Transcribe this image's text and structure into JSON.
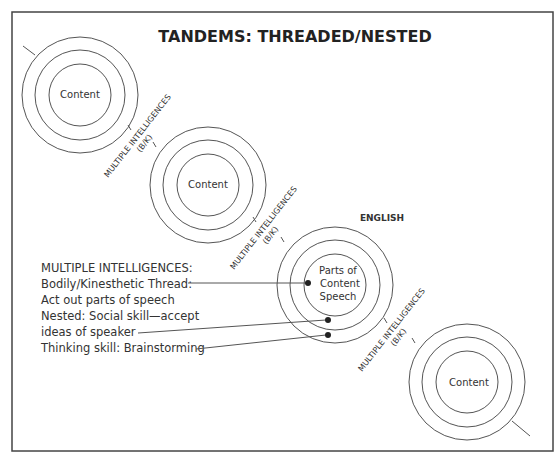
{
  "title": "TANDEMS: THREADED/NESTED",
  "circles": [
    {
      "label": "Content"
    },
    {
      "label": "Content"
    },
    {
      "label_lines": [
        "Parts of",
        "Content",
        "Speech"
      ],
      "subject": "ENGLISH"
    },
    {
      "label": "Content"
    }
  ],
  "thread_labels": [
    {
      "line1": "MULTIPLE INTELLIGENCES",
      "line2": "(B/K)"
    },
    {
      "line1": "MULTIPLE INTELLIGENCES",
      "line2": "(B/K)"
    },
    {
      "line1": "MULTIPLE INTELLIGENCES",
      "line2": "(B/K)"
    }
  ],
  "legend": {
    "lines": [
      "MULTIPLE INTELLIGENCES:",
      "Bodily/Kinesthetic Thread:",
      "Act out parts of speech",
      "Nested: Social skill—accept",
      "ideas of speaker",
      "Thinking skill: Brainstorming"
    ]
  }
}
